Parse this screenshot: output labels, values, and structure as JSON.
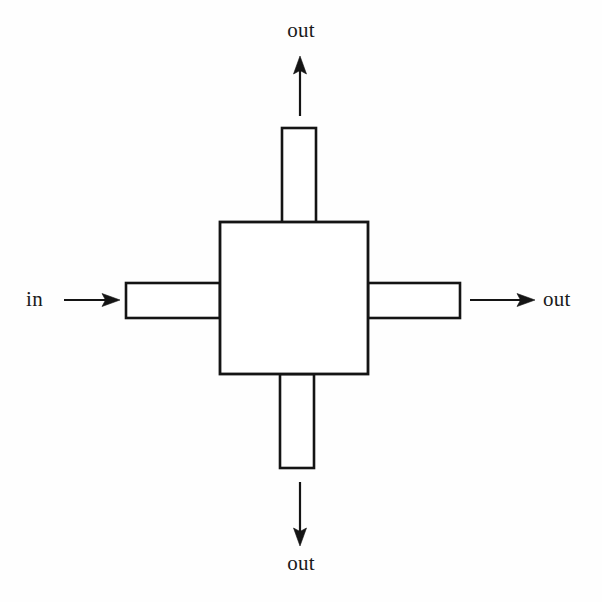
{
  "diagram": {
    "type": "block-schematic",
    "title_visible": false,
    "background_color": "#fefefe",
    "stroke_color": "#141414",
    "fill_color": "#ffffff",
    "stroke_width": 2.6,
    "central_block": {
      "name": "central-square-block",
      "x": 220,
      "y": 222,
      "width": 148,
      "height": 152,
      "label": ""
    },
    "arms": [
      {
        "name": "top-arm",
        "direction": "up",
        "x": 282,
        "y": 128,
        "width": 34,
        "height": 100
      },
      {
        "name": "right-arm",
        "direction": "right",
        "x": 368,
        "y": 283,
        "width": 92,
        "height": 35
      },
      {
        "name": "bottom-arm",
        "direction": "down",
        "x": 280,
        "y": 374,
        "width": 34,
        "height": 94
      },
      {
        "name": "left-arm",
        "direction": "left",
        "x": 126,
        "y": 283,
        "width": 94,
        "height": 35
      }
    ],
    "arrows": [
      {
        "name": "arrow-out-top",
        "direction": "up",
        "label": "out",
        "from_x": 300,
        "from_y": 116,
        "to_x": 300,
        "to_y": 56
      },
      {
        "name": "arrow-out-right",
        "direction": "right",
        "label": "out",
        "from_x": 470,
        "from_y": 300,
        "to_x": 535,
        "to_y": 300
      },
      {
        "name": "arrow-out-bottom",
        "direction": "down",
        "label": "out",
        "from_x": 300,
        "from_y": 482,
        "to_x": 300,
        "to_y": 546
      },
      {
        "name": "arrow-in-left",
        "direction": "right",
        "label": "in",
        "from_x": 64,
        "from_y": 300,
        "to_x": 120,
        "to_y": 300
      }
    ]
  },
  "labels": {
    "top": "out",
    "right": "out",
    "bottom": "out",
    "left": "in"
  }
}
